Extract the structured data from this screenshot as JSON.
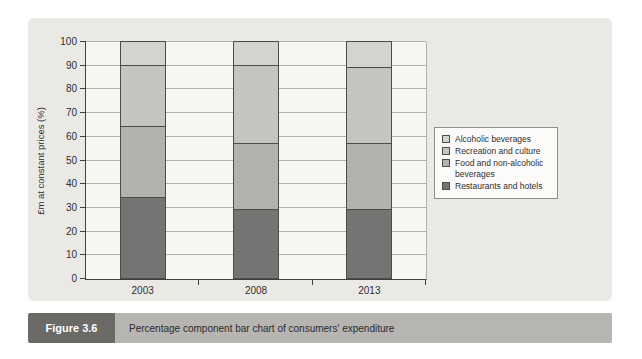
{
  "figure": {
    "label": "Figure 3.6",
    "caption": "Percentage component bar chart of consumers' expenditure"
  },
  "chart_data": {
    "type": "bar",
    "stacked": true,
    "percentage": true,
    "title": "",
    "categories": [
      "2003",
      "2008",
      "2013"
    ],
    "series": [
      {
        "name": "Restaurants and hotels",
        "values": [
          34,
          29,
          29
        ],
        "color": "#767472"
      },
      {
        "name": "Food and non-alcoholic beverages",
        "values": [
          30,
          28,
          28
        ],
        "color": "#b3b2af"
      },
      {
        "name": "Recreation and culture",
        "values": [
          26,
          33,
          32
        ],
        "color": "#c5c4c1"
      },
      {
        "name": "Alcoholic beverages",
        "values": [
          10,
          10,
          11
        ],
        "color": "#d4d3d0"
      }
    ],
    "xlabel": "",
    "ylabel": "£m at constant prices (%)",
    "ylim": [
      0,
      100
    ],
    "ytick_step": 10,
    "grid": true,
    "legend_position": "right",
    "legend_order_top_to_bottom": [
      "Alcoholic beverages",
      "Recreation and culture",
      "Food and non-alcoholic beverages",
      "Restaurants and hotels"
    ]
  },
  "colors": {
    "panel_background": "#ebe9e6",
    "plot_background": "#f7f6f3",
    "gridline": "#b3b1ae",
    "axis": "#3f3f3f",
    "segment_border": "#4c4c4a",
    "legend_background": "#fcfbfa",
    "caption_label_background": "#6b6a67",
    "caption_bar_background": "#b7b5b2"
  }
}
